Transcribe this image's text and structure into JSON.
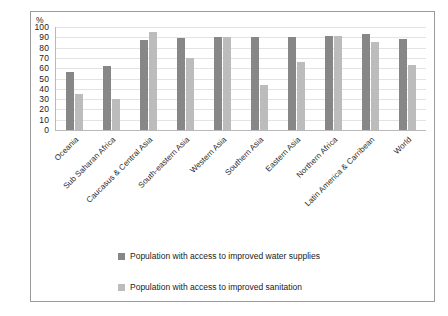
{
  "chart_data": {
    "type": "bar",
    "title": "",
    "xlabel": "",
    "ylabel": "%",
    "ylim": [
      0,
      100
    ],
    "yticks": [
      0,
      10,
      20,
      30,
      40,
      50,
      60,
      70,
      80,
      90,
      100
    ],
    "grid": true,
    "legend_position": "bottom",
    "categories": [
      "Oceania",
      "Sub Saharan Africa",
      "Caucasus & Central Asia",
      "South-eastern Asia",
      "Western Asia",
      "Southern Asia",
      "Eastern Asia",
      "Northern Africa",
      "Latin America & Carribean",
      "World"
    ],
    "series": [
      {
        "name": "Population with access to improved water supplies",
        "color": "#878787",
        "values": [
          56,
          62,
          87,
          89,
          90,
          90,
          90,
          91,
          93,
          88
        ]
      },
      {
        "name": "Population with access to improved sanitation",
        "color": "#bcbcbc",
        "values": [
          35,
          30,
          95,
          70,
          90,
          44,
          66,
          91,
          85,
          63
        ]
      }
    ]
  }
}
